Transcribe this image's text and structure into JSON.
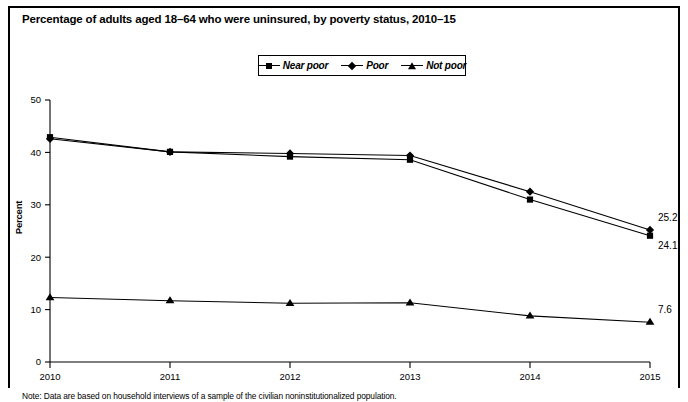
{
  "figure": {
    "title": "Percentage of adults aged 18–64 who were uninsured, by poverty status, 2010–15",
    "note": "Note: Data are based on household interviews of a sample of the civilian noninstitutionalized population."
  },
  "legend": {
    "position": "top-center",
    "entries": [
      {
        "label": "Near poor",
        "marker": "square-marker"
      },
      {
        "label": "Poor",
        "marker": "diamond-marker"
      },
      {
        "label": "Not poor",
        "marker": "triangle-marker"
      }
    ]
  },
  "chart_data": {
    "type": "line",
    "title": "Percentage of adults aged 18–64 who were uninsured, by poverty status, 2010–15",
    "xlabel": "",
    "ylabel": "Percent",
    "x": [
      "2010",
      "2011",
      "2012",
      "2013",
      "2014",
      "2015"
    ],
    "xticklabels": [
      "2010",
      "2011",
      "2012",
      "2013",
      "2014",
      "2015"
    ],
    "yticklabels": [
      "0",
      "10",
      "20",
      "30",
      "40",
      "50"
    ],
    "ylim": [
      0,
      50
    ],
    "ytick_step": 10,
    "grid": false,
    "series": [
      {
        "name": "Poor",
        "marker": "diamond-marker",
        "values": [
          42.6,
          40.1,
          39.8,
          39.4,
          32.5,
          25.2
        ],
        "end_label": "25.2"
      },
      {
        "name": "Near poor",
        "marker": "square-marker",
        "values": [
          42.9,
          40.1,
          39.2,
          38.6,
          31.0,
          24.1
        ],
        "end_label": "24.1"
      },
      {
        "name": "Not poor",
        "marker": "triangle-marker",
        "values": [
          12.3,
          11.7,
          11.2,
          11.3,
          8.8,
          7.6
        ],
        "end_label": "7.6"
      }
    ],
    "annotations": [
      {
        "text": "25.2",
        "series": "Poor",
        "x": "2015"
      },
      {
        "text": "24.1",
        "series": "Near poor",
        "x": "2015"
      },
      {
        "text": "7.6",
        "series": "Not poor",
        "x": "2015"
      }
    ]
  },
  "axes": {
    "y_ticks": [
      {
        "label": "50",
        "value": 50
      },
      {
        "label": "40",
        "value": 40
      },
      {
        "label": "30",
        "value": 30
      },
      {
        "label": "20",
        "value": 20
      },
      {
        "label": "10",
        "value": 10
      },
      {
        "label": "0",
        "value": 0
      }
    ],
    "x_ticks": [
      {
        "label": "2010"
      },
      {
        "label": "2011"
      },
      {
        "label": "2012"
      },
      {
        "label": "2013"
      },
      {
        "label": "2014"
      },
      {
        "label": "2015"
      }
    ]
  }
}
